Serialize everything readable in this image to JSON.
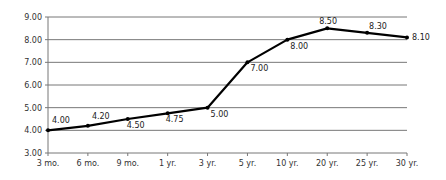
{
  "chart_data": {
    "type": "line",
    "title": "",
    "xlabel": "",
    "ylabel": "",
    "categories": [
      "3 mo.",
      "6 mo.",
      "9 mo.",
      "1 yr.",
      "3 yr.",
      "5 yr.",
      "10 yr.",
      "20 yr.",
      "25 yr.",
      "30 yr."
    ],
    "series": [
      {
        "name": "Yield",
        "values": [
          4.0,
          4.2,
          4.5,
          4.75,
          5.0,
          7.0,
          8.0,
          8.5,
          8.3,
          8.1
        ],
        "labels": [
          "4.00",
          "4.20",
          "4.50",
          "4.75",
          "5.00",
          "7.00",
          "8.00",
          "8.50",
          "8.30",
          "8.10"
        ],
        "color": "#000000"
      }
    ],
    "ylim": [
      3.0,
      9.0
    ],
    "yticks": [
      "3.00",
      "4.00",
      "5.00",
      "6.00",
      "7.00",
      "8.00",
      "9.00"
    ],
    "grid": true,
    "legend": "none"
  }
}
